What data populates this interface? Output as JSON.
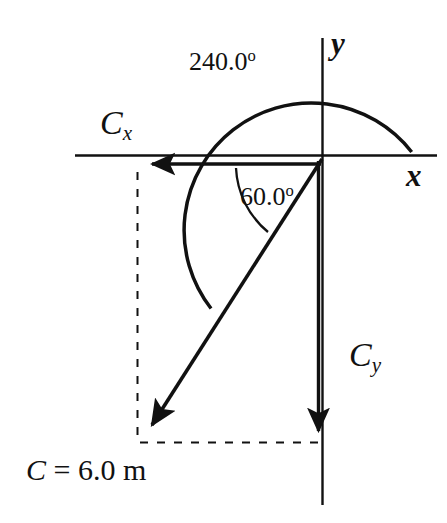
{
  "figure": {
    "type": "vector-component-diagram",
    "background_color": "#ffffff",
    "stroke_color": "#111111"
  },
  "axes": {
    "x_label": "x",
    "y_label": "y",
    "origin": {
      "x": 322,
      "y": 155
    },
    "x_axis": {
      "x1": 75,
      "y1": 155,
      "x2": 437,
      "y2": 155
    },
    "y_axis": {
      "x1": 322,
      "y1": 38,
      "x2": 322,
      "y2": 505
    }
  },
  "vectors": {
    "resultant": {
      "label": "C",
      "magnitude_text": "C = 6.0 m",
      "magnitude_symbol": "C",
      "magnitude_equals": "=",
      "magnitude_value": "6.0",
      "magnitude_unit": "m",
      "from": {
        "x": 322,
        "y": 160
      },
      "to": {
        "x": 143,
        "y": 440
      }
    },
    "x_component": {
      "label_symbol": "C",
      "label_subscript": "x",
      "from": {
        "x": 322,
        "y": 163
      },
      "to": {
        "x": 142,
        "y": 163
      }
    },
    "y_component": {
      "label_symbol": "C",
      "label_subscript": "y",
      "from": {
        "x": 318,
        "y": 160
      },
      "to": {
        "x": 318,
        "y": 443
      }
    }
  },
  "angles": {
    "standard": {
      "value": "240.0",
      "degree_symbol": "o",
      "text": "240.0",
      "measured_from": "positive-x-axis",
      "direction": "counterclockwise"
    },
    "reference": {
      "value": "60.0",
      "degree_symbol": "o",
      "text": "60.0",
      "measured_from": "negative-x-axis",
      "direction": "clockwise"
    }
  },
  "guides": {
    "dashed_vertical": {
      "x": 137,
      "y1": 172,
      "y2": 442
    },
    "dashed_horizontal": {
      "y": 442,
      "x1": 140,
      "x2": 318
    }
  }
}
